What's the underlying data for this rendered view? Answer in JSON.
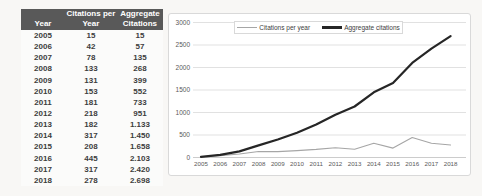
{
  "table": {
    "header": {
      "year": "Year",
      "citations_line1": "Citations per",
      "citations_line2": "Year",
      "aggregate_line1": "Aggregate",
      "aggregate_line2": "Citations"
    },
    "rows": [
      [
        "2005",
        "15",
        "15"
      ],
      [
        "2006",
        "42",
        "57"
      ],
      [
        "2007",
        "78",
        "135"
      ],
      [
        "2008",
        "133",
        "268"
      ],
      [
        "2009",
        "131",
        "399"
      ],
      [
        "2010",
        "153",
        "552"
      ],
      [
        "2011",
        "181",
        "733"
      ],
      [
        "2012",
        "218",
        "951"
      ],
      [
        "2013",
        "182",
        "1.133"
      ],
      [
        "2014",
        "317",
        "1.450"
      ],
      [
        "2015",
        "208",
        "1.658"
      ],
      [
        "2016",
        "445",
        "2.103"
      ],
      [
        "2017",
        "317",
        "2.420"
      ],
      [
        "2018",
        "278",
        "2.698"
      ]
    ]
  },
  "chart_data": {
    "type": "line",
    "x": [
      2005,
      2006,
      2007,
      2008,
      2009,
      2010,
      2011,
      2012,
      2013,
      2014,
      2015,
      2016,
      2017,
      2018
    ],
    "series": [
      {
        "name": "Citations per year",
        "color": "#a6a6a6",
        "stroke_width": 1.1,
        "values": [
          15,
          42,
          78,
          133,
          131,
          153,
          181,
          218,
          182,
          317,
          208,
          445,
          317,
          278
        ]
      },
      {
        "name": "Aggregate citations",
        "color": "#262626",
        "stroke_width": 2.2,
        "values": [
          15,
          57,
          135,
          268,
          399,
          552,
          733,
          951,
          1133,
          1450,
          1658,
          2103,
          2420,
          2698
        ]
      }
    ],
    "title": "",
    "xlabel": "",
    "ylabel": "",
    "ylim": [
      0,
      3000
    ],
    "ytick_step": 500,
    "yticks": [
      "0",
      "500",
      "1000",
      "1500",
      "2000",
      "2500",
      "3000"
    ],
    "grid": true,
    "legend_position": "top-center",
    "gridline_color": "#d9d9d9",
    "axis_line_color": "#bfbfbf"
  }
}
